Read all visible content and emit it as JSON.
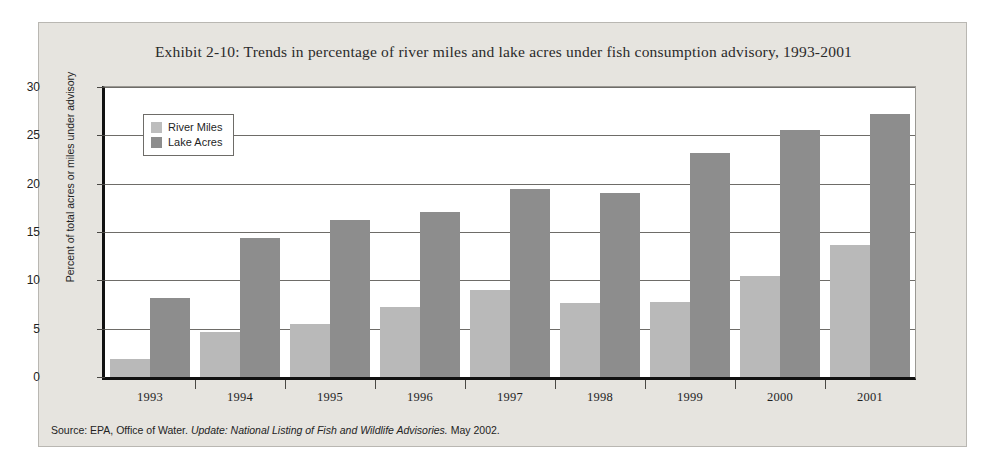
{
  "chart_data": {
    "type": "bar",
    "title": "Exhibit 2-10: Trends in percentage of river miles and lake acres under fish consumption advisory, 1993-2001",
    "xlabel": "",
    "ylabel": "Percent of total acres or miles under advisory",
    "categories": [
      "1993",
      "1994",
      "1995",
      "1996",
      "1997",
      "1998",
      "1999",
      "2000",
      "2001"
    ],
    "series": [
      {
        "name": "River Miles",
        "color": "#b9b9b9",
        "values": [
          1.9,
          4.7,
          5.5,
          7.2,
          9.0,
          7.7,
          7.8,
          10.4,
          13.7
        ]
      },
      {
        "name": "Lake Acres",
        "color": "#8d8d8d",
        "values": [
          8.2,
          14.4,
          16.2,
          17.1,
          19.4,
          19.0,
          23.2,
          25.6,
          27.2
        ]
      }
    ],
    "ylim": [
      0,
      30
    ],
    "yticks": [
      0,
      5,
      10,
      15,
      20,
      25,
      30
    ],
    "ytick_labels": [
      "0",
      "5",
      "10",
      "15",
      "20",
      "25",
      "30"
    ],
    "grid": true,
    "legend_position": "top-left"
  },
  "source": {
    "prefix": "Source: EPA, Office of Water.",
    "italic": "Update: National Listing of Fish and Wildlife Advisories.",
    "suffix": "May 2002."
  }
}
